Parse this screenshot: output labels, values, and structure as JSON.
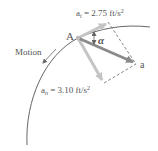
{
  "diagram": {
    "point_label": "A",
    "motion_label": "Motion",
    "angle_label": "α",
    "resultant_label": "a",
    "tangential": {
      "symbol": "a",
      "subscript": "t",
      "value_text": " = 2.75 ft/s",
      "exponent": "2"
    },
    "normal": {
      "symbol": "a",
      "subscript": "n",
      "value_text": " = 3.10 ft/s",
      "exponent": "2"
    },
    "colors": {
      "path": "#555555",
      "resultant_arrow": "#8a8a8a",
      "component_arrows": "#c4c4c4",
      "dashed": "#666666",
      "text": "#555555"
    }
  }
}
